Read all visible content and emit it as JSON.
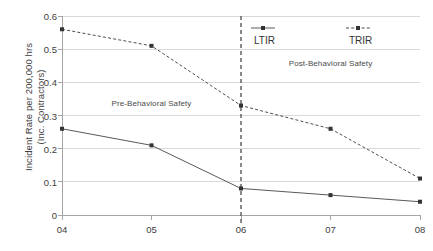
{
  "chart_data": {
    "type": "line",
    "title": "",
    "xlabel": "",
    "ylabel": "Incident Rate per 200,000 hrs (Inc. Contractors)",
    "ylabel_line1": "Incident Rate per 200,000 hrs",
    "ylabel_line2": "(Inc. Contractors)",
    "categories": [
      "04",
      "05",
      "06",
      "07",
      "08"
    ],
    "ylim": [
      0,
      0.6
    ],
    "yticks": [
      "0.6",
      "0.5",
      "0.4",
      "0.3",
      "0.2",
      "0.1",
      "0"
    ],
    "ytick_values": [
      0.6,
      0.5,
      0.4,
      0.3,
      0.2,
      0.1,
      0
    ],
    "grid": true,
    "legend_position": "top-right",
    "series": [
      {
        "name": "LTIR",
        "values": [
          0.26,
          0.21,
          0.08,
          0.06,
          0.04
        ],
        "style": "solid",
        "color": "#595959",
        "marker": "square"
      },
      {
        "name": "TRIR",
        "values": [
          0.56,
          0.51,
          0.33,
          0.26,
          0.11
        ],
        "style": "dashed",
        "color": "#4d4d4d",
        "marker": "square"
      }
    ],
    "annotations": [
      {
        "text": "Pre-Behavioral Safety",
        "x_category": "05",
        "y_value": 0.335
      },
      {
        "text": "Post-Behavioral Safety",
        "x_category": "07",
        "y_value": 0.455
      }
    ],
    "reference_line": {
      "x_category": "06",
      "style": "dashed",
      "color": "#595959"
    }
  },
  "legend": {
    "items": [
      {
        "label": "LTIR"
      },
      {
        "label": "TRIR"
      }
    ]
  },
  "colors": {
    "grid": "#d9d9d9",
    "axis": "#a6a6a6",
    "text": "#404040",
    "series_ltir": "#595959",
    "series_trir": "#4d4d4d",
    "reference_line": "#595959",
    "background": "#ffffff"
  }
}
